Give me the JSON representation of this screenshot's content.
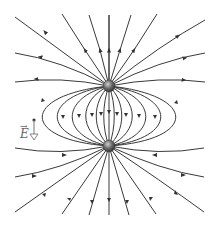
{
  "diagram": {
    "label": "E",
    "label_has_vector_arrow": true,
    "colors": {
      "line": "#3a3a3a",
      "charge_fill": "#555555",
      "label": "#666666",
      "vector_arrow": "#777777"
    },
    "charges": [
      {
        "name": "top-charge",
        "x": 109,
        "y": 86,
        "r": 6
      },
      {
        "name": "bottom-charge",
        "x": 109,
        "y": 146,
        "r": 6
      }
    ]
  }
}
